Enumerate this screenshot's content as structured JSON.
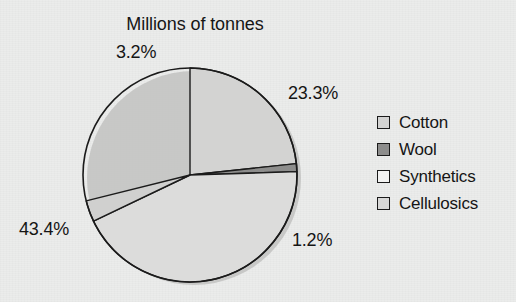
{
  "chart_data": {
    "type": "pie",
    "title": "Millions of tonnes",
    "xlabel": "",
    "ylabel": "",
    "legend_position": "right",
    "grid": false,
    "start_angle_deg": 0,
    "direction": "clockwise",
    "categories": [
      "Cotton",
      "Wool",
      "Synthetics",
      "Cellulosics"
    ],
    "values": [
      23.3,
      1.2,
      43.4,
      3.2
    ],
    "value_unit": "%",
    "slices": [
      {
        "label": "Cotton",
        "value": 23.3,
        "value_text": "23.3%",
        "color": "#d3d3d2",
        "start_deg": 0.0,
        "end_deg": 83.9
      },
      {
        "label": "Wool",
        "value": 1.2,
        "value_text": "1.2%",
        "color": "#8d8d8c",
        "start_deg": 83.9,
        "end_deg": 88.2
      },
      {
        "label": "Synthetics",
        "value": 43.4,
        "value_text": "43.4%",
        "color": "#dcdcdb",
        "start_deg": 88.2,
        "end_deg": 244.4
      },
      {
        "label": "Cellulosics",
        "value": 3.2,
        "value_text": "3.2%",
        "color": "#d0d0cf",
        "start_deg": 244.4,
        "end_deg": 256.0
      }
    ],
    "total_shown": 71.1
  },
  "title": "Millions of tonnes",
  "labels": {
    "cellulosics": "3.2%",
    "cotton": "23.3%",
    "wool": "1.2%",
    "synthetics": "43.4%"
  },
  "legend": {
    "items": [
      {
        "label": "Cotton",
        "swatch": "#d3d3d2"
      },
      {
        "label": "Wool",
        "swatch": "#8d8d8c"
      },
      {
        "label": "Synthetics",
        "swatch": "#f3f3f2"
      },
      {
        "label": "Cellulosics",
        "swatch": "#d8d8d7"
      }
    ]
  },
  "colors": {
    "background": "#ebeceb",
    "outline": "#1b1b1b",
    "text": "#151515",
    "shadow": "#b9b9b8"
  }
}
